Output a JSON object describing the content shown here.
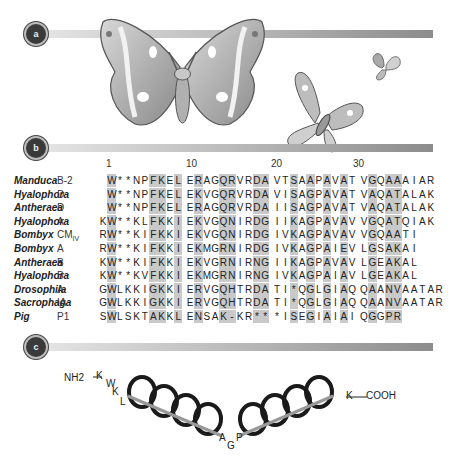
{
  "panels": {
    "a": {
      "label": "a"
    },
    "b": {
      "label": "b"
    },
    "c": {
      "label": "c"
    }
  },
  "alignment": {
    "position_ticks": [
      {
        "label": "1",
        "x": 106
      },
      {
        "label": "10",
        "x": 186
      },
      {
        "label": "20",
        "x": 271
      },
      {
        "label": "30",
        "x": 353
      }
    ],
    "rows": [
      {
        "species": "Manduca",
        "isoform": "B-2",
        "sequence": " W**NPFKEL ERAGQRVRDA VTSAAPAVAT VGQAAAIAR"
      },
      {
        "species": "Hyalophora",
        "isoform": "D",
        "sequence": " W**NPFKEL EKVGQRVRDA VISAGPAVAT VAQATALAK"
      },
      {
        "species": "Antheraea",
        "isoform": "D",
        "sequence": " W**NPFKEL ERAGQRVRDA IISAGPAVAT VAQATALAK"
      },
      {
        "species": "Hyalophora",
        "isoform": "A",
        "sequence": "KW**KLFKKI EKVGQNIRDG IIKAGPAVAV VGQATQIAK"
      },
      {
        "species": "Bombyx",
        "isoform": "CM",
        "isoform_sub": "IV",
        "sequence": "RW**KIFKKI EKVGQNIRDG IVKAGPAVAV VGQAATI"
      },
      {
        "species": "Bombyx",
        "isoform": "A",
        "sequence": "RW**KIFKKI EKMGRNIRDG IVKAGPAIEV LGSAKAI"
      },
      {
        "species": "Antheraea",
        "isoform": "B",
        "sequence": "KW**KIFKKI EKVGRNIRNG IIKAGPAVAV LGEAKAL"
      },
      {
        "species": "Hyalophora",
        "isoform": "B",
        "sequence": "KW**KVFKKI EKMGRNIRNG IVKAGPAIAV LGEAKAL"
      },
      {
        "species": "Drosophila",
        "isoform": "A",
        "sequence": "GWLKKIGKKI ERVGQHTRDA TI*QGLGIAQ QAANVAATAR"
      },
      {
        "species": "Sacrophaga",
        "isoform": "IA",
        "sequence": "GWLKKIGKKI ERVGQHTRDA TI*QGLGIAQ QAANVAATAR"
      },
      {
        "species": "Pig",
        "isoform": "P1",
        "sequence": "SWLSKTAKKL ENSAK-KR** *ISEGIAIAI QGGPR"
      }
    ],
    "shaded_columns": [
      1,
      6,
      7,
      9,
      11,
      14,
      15,
      18,
      19,
      22,
      24,
      26,
      28,
      31,
      33,
      34
    ]
  },
  "helix_diagram": {
    "n_terminus": "NH2",
    "n_residues": [
      "K",
      "W",
      "K",
      "L"
    ],
    "hinge_residues": [
      "A",
      "G",
      "P"
    ],
    "c_residue": "K",
    "c_terminus": "COOH"
  },
  "colors": {
    "shade": "#c9c9c9",
    "band_start": "#e6e6e6",
    "band_end": "#8c8c8c",
    "badge": "#3a3a3a"
  }
}
